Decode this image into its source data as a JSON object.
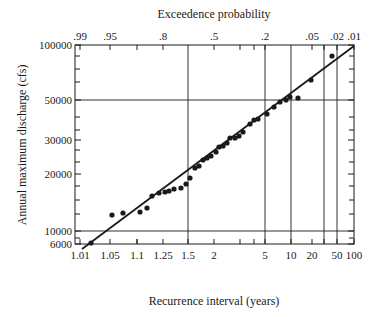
{
  "chart_data": {
    "type": "scatter",
    "title": "Exceedence probability",
    "xlabel": "Recurrence interval (years)",
    "ylabel": "Annual maximum discharge (cfs)",
    "x_scale": "probability (Gumbel/normal)",
    "y_scale": "log",
    "ylim": [
      6000,
      100000
    ],
    "y_ticks": [
      {
        "label": "100000",
        "value": 100000,
        "py": 45
      },
      {
        "label": "50000",
        "value": 50000,
        "py": 100
      },
      {
        "label": "30000",
        "value": 30000,
        "py": 140
      },
      {
        "label": "20000",
        "value": 20000,
        "py": 174
      },
      {
        "label": "10000",
        "value": 10000,
        "py": 231
      },
      {
        "label": "6000",
        "value": 6000,
        "py": 244
      }
    ],
    "y_minor_py": [
      56,
      69,
      82,
      117,
      130,
      150,
      162,
      186,
      200,
      214,
      238
    ],
    "y_gridlines_py": [
      100,
      231
    ],
    "x_bottom_ticks": [
      {
        "label": "1.01",
        "px": 80
      },
      {
        "label": "1.05",
        "px": 110
      },
      {
        "label": "1.1",
        "px": 137
      },
      {
        "label": "1.25",
        "px": 163
      },
      {
        "label": "1.5",
        "px": 188
      },
      {
        "label": "2",
        "px": 214
      },
      {
        "label": "5",
        "px": 265
      },
      {
        "label": "10",
        "px": 291
      },
      {
        "label": "20",
        "px": 312
      },
      {
        "label": "50",
        "px": 337
      },
      {
        "label": "100",
        "px": 354
      }
    ],
    "x_top_ticks": [
      {
        "label": ".99",
        "px": 80
      },
      {
        "label": ".95",
        "px": 110
      },
      {
        "label": ".8",
        "px": 163
      },
      {
        "label": ".5",
        "px": 214
      },
      {
        "label": ".2",
        "px": 265
      },
      {
        "label": ".05",
        "px": 312
      },
      {
        "label": ".02",
        "px": 337
      },
      {
        "label": ".01",
        "px": 354
      }
    ],
    "x_minor_px": [
      137,
      240,
      254,
      324
    ],
    "x_gridlines_px": [
      188,
      265,
      291,
      324,
      337
    ],
    "fit_line": {
      "x1": 82,
      "y1": 249,
      "x2": 354,
      "y2": 46
    },
    "points": [
      {
        "px": 91,
        "py": 243,
        "recurrence": 1.02,
        "discharge": 8800
      },
      {
        "px": 112,
        "py": 215,
        "recurrence": 1.06,
        "discharge": 12500
      },
      {
        "px": 123,
        "py": 213,
        "recurrence": 1.08,
        "discharge": 12800
      },
      {
        "px": 140,
        "py": 212,
        "recurrence": 1.12,
        "discharge": 13000
      },
      {
        "px": 147,
        "py": 208,
        "recurrence": 1.15,
        "discharge": 13500
      },
      {
        "px": 152,
        "py": 196,
        "recurrence": 1.18,
        "discharge": 15500
      },
      {
        "px": 159,
        "py": 193,
        "recurrence": 1.22,
        "discharge": 16000
      },
      {
        "px": 165,
        "py": 192,
        "recurrence": 1.27,
        "discharge": 16200
      },
      {
        "px": 169,
        "py": 191,
        "recurrence": 1.3,
        "discharge": 16500
      },
      {
        "px": 174,
        "py": 189,
        "recurrence": 1.35,
        "discharge": 17000
      },
      {
        "px": 181,
        "py": 188,
        "recurrence": 1.42,
        "discharge": 17200
      },
      {
        "px": 186,
        "py": 184,
        "recurrence": 1.47,
        "discharge": 18000
      },
      {
        "px": 190,
        "py": 178,
        "recurrence": 1.52,
        "discharge": 19500
      },
      {
        "px": 195,
        "py": 168,
        "recurrence": 1.6,
        "discharge": 21500
      },
      {
        "px": 199,
        "py": 166,
        "recurrence": 1.65,
        "discharge": 22500
      },
      {
        "px": 203,
        "py": 160,
        "recurrence": 1.72,
        "discharge": 24000
      },
      {
        "px": 207,
        "py": 158,
        "recurrence": 1.8,
        "discharge": 24500
      },
      {
        "px": 211,
        "py": 156,
        "recurrence": 1.9,
        "discharge": 25000
      },
      {
        "px": 216,
        "py": 152,
        "recurrence": 2.05,
        "discharge": 26500
      },
      {
        "px": 219,
        "py": 147,
        "recurrence": 2.15,
        "discharge": 28000
      },
      {
        "px": 223,
        "py": 146,
        "recurrence": 2.25,
        "discharge": 28500
      },
      {
        "px": 227,
        "py": 143,
        "recurrence": 2.4,
        "discharge": 29500
      },
      {
        "px": 230,
        "py": 138,
        "recurrence": 2.55,
        "discharge": 31000
      },
      {
        "px": 235,
        "py": 138,
        "recurrence": 2.75,
        "discharge": 31000
      },
      {
        "px": 239,
        "py": 136,
        "recurrence": 2.95,
        "discharge": 32000
      },
      {
        "px": 243,
        "py": 132,
        "recurrence": 3.2,
        "discharge": 34000
      },
      {
        "px": 250,
        "py": 124,
        "recurrence": 3.7,
        "discharge": 37000
      },
      {
        "px": 254,
        "py": 120,
        "recurrence": 4.1,
        "discharge": 39000
      },
      {
        "px": 258,
        "py": 119,
        "recurrence": 4.5,
        "discharge": 39500
      },
      {
        "px": 267,
        "py": 114,
        "recurrence": 5.4,
        "discharge": 42000
      },
      {
        "px": 274,
        "py": 107,
        "recurrence": 6.5,
        "discharge": 46000
      },
      {
        "px": 280,
        "py": 102,
        "recurrence": 7.5,
        "discharge": 49000
      },
      {
        "px": 286,
        "py": 100,
        "recurrence": 8.8,
        "discharge": 50000
      },
      {
        "px": 290,
        "py": 97,
        "recurrence": 9.8,
        "discharge": 52000
      },
      {
        "px": 298,
        "py": 98,
        "recurrence": 12,
        "discharge": 51500
      },
      {
        "px": 311,
        "py": 80,
        "recurrence": 19,
        "discharge": 64000
      },
      {
        "px": 332,
        "py": 56,
        "recurrence": 43,
        "discharge": 86000
      }
    ]
  },
  "plot_box": {
    "left": 75,
    "top": 45,
    "right": 354,
    "bottom": 244
  }
}
